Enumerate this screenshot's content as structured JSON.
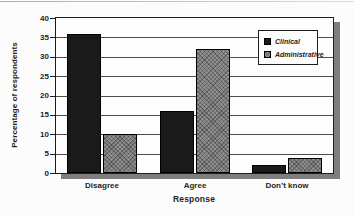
{
  "chart_data": {
    "type": "bar",
    "title": "",
    "categories": [
      "Disagree",
      "Agree",
      "Don’t know"
    ],
    "series": [
      {
        "name": "Clinical",
        "values": [
          36,
          16,
          2
        ],
        "color": "#1a1a1a",
        "pattern": "solid"
      },
      {
        "name": "Administrative",
        "values": [
          10,
          32,
          4
        ],
        "color": "#8f8f8f",
        "pattern": "crosshatch"
      }
    ],
    "xlabel": "Response",
    "ylabel": "Percentage of respondents",
    "ylim": [
      0,
      40
    ],
    "yticks": [
      0,
      5,
      10,
      15,
      20,
      25,
      30,
      35,
      40
    ],
    "grid": "horizontal",
    "legend_position": "top-right"
  },
  "colors": {
    "background": "#fcfcfc",
    "plot_background": "#fdfdfd",
    "bar_clinical": "#1a1a1a",
    "bar_administrative": "#8f8f8f",
    "plot_border": "#1c1c1c",
    "drop_shadow": "#7e7e7e",
    "gridline": "#4d4d4d",
    "text": "#1f1f1f"
  }
}
